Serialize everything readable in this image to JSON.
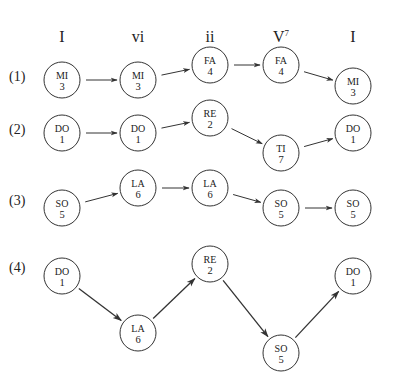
{
  "headers": [
    {
      "label": "I",
      "x": 62
    },
    {
      "label": "vi",
      "x": 138
    },
    {
      "label": "ii",
      "x": 210
    },
    {
      "label": "V",
      "sup": "7",
      "x": 281
    },
    {
      "label": "I",
      "x": 353
    }
  ],
  "rows": [
    {
      "label": "(1)",
      "label_y": 81,
      "nodes": [
        {
          "syllable": "MI",
          "degree": "3",
          "x": 62,
          "y": 80
        },
        {
          "syllable": "MI",
          "degree": "3",
          "x": 138,
          "y": 80
        },
        {
          "syllable": "FA",
          "degree": "4",
          "x": 210,
          "y": 65
        },
        {
          "syllable": "FA",
          "degree": "4",
          "x": 281,
          "y": 65
        },
        {
          "syllable": "MI",
          "degree": "3",
          "x": 353,
          "y": 86
        }
      ]
    },
    {
      "label": "(2)",
      "label_y": 134,
      "nodes": [
        {
          "syllable": "DO",
          "degree": "1",
          "x": 62,
          "y": 133
        },
        {
          "syllable": "DO",
          "degree": "1",
          "x": 138,
          "y": 133
        },
        {
          "syllable": "RE",
          "degree": "2",
          "x": 210,
          "y": 118
        },
        {
          "syllable": "TI",
          "degree": "7",
          "x": 281,
          "y": 153
        },
        {
          "syllable": "DO",
          "degree": "1",
          "x": 353,
          "y": 133
        }
      ]
    },
    {
      "label": "(3)",
      "label_y": 205,
      "nodes": [
        {
          "syllable": "SO",
          "degree": "5",
          "x": 62,
          "y": 208
        },
        {
          "syllable": "LA",
          "degree": "6",
          "x": 138,
          "y": 188
        },
        {
          "syllable": "LA",
          "degree": "6",
          "x": 210,
          "y": 188
        },
        {
          "syllable": "SO",
          "degree": "5",
          "x": 281,
          "y": 208
        },
        {
          "syllable": "SO",
          "degree": "5",
          "x": 353,
          "y": 208
        }
      ]
    },
    {
      "label": "(4)",
      "label_y": 272,
      "nodes": [
        {
          "syllable": "DO",
          "degree": "1",
          "x": 62,
          "y": 276
        },
        {
          "syllable": "LA",
          "degree": "6",
          "x": 138,
          "y": 333
        },
        {
          "syllable": "RE",
          "degree": "2",
          "x": 210,
          "y": 264
        },
        {
          "syllable": "SO",
          "degree": "5",
          "x": 281,
          "y": 353
        },
        {
          "syllable": "DO",
          "degree": "1",
          "x": 353,
          "y": 276
        }
      ]
    }
  ]
}
